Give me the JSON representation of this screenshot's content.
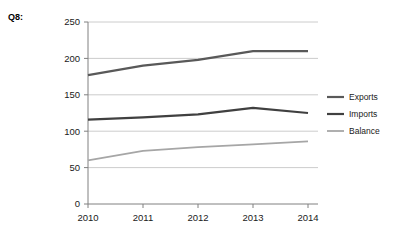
{
  "label": {
    "question": "Q8:"
  },
  "chart_data": {
    "type": "line",
    "title": "",
    "subtitle": "",
    "xlabel": "",
    "ylabel": "",
    "categories": [
      "2010",
      "2011",
      "2012",
      "2013",
      "2014"
    ],
    "x": [
      2010,
      2011,
      2012,
      2013,
      2014
    ],
    "series": [
      {
        "name": "Exports",
        "values": [
          177,
          190,
          198,
          210,
          210
        ],
        "color": "#595959",
        "width": 2.2
      },
      {
        "name": "Imports",
        "values": [
          116,
          119,
          123,
          132,
          125
        ],
        "color": "#404040",
        "width": 2.2
      },
      {
        "name": "Balance",
        "values": [
          60,
          73,
          78,
          82,
          86
        ],
        "color": "#a6a6a6",
        "width": 1.8
      }
    ],
    "ylim": [
      0,
      250
    ],
    "yticks": [
      0,
      50,
      100,
      150,
      200,
      250
    ],
    "ytick_labels": [
      "0",
      "50",
      "100",
      "150",
      "200",
      "250"
    ],
    "xtick_labels": [
      "2010",
      "2011",
      "2012",
      "2013",
      "2014"
    ],
    "grid": "horizontal",
    "grid_color": "#bfbfbf",
    "axis_color": "#808080",
    "legend_position": "right",
    "legend_entries": [
      "Exports",
      "Imports",
      "Balance"
    ]
  }
}
